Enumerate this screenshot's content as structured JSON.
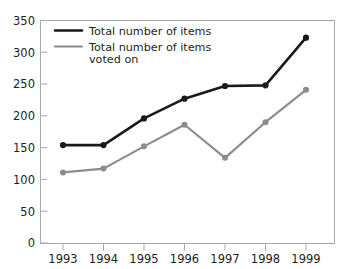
{
  "chart_data": {
    "type": "line",
    "title": "",
    "subtitle": "",
    "xlabel": "",
    "ylabel": "",
    "categories": [
      "1993",
      "1994",
      "1995",
      "1996",
      "1997",
      "1998",
      "1999"
    ],
    "x": [
      1993,
      1994,
      1995,
      1996,
      1997,
      1998,
      1999
    ],
    "xlim": [
      1993,
      1999
    ],
    "ylim": [
      0,
      350
    ],
    "ytick_labels": [
      "0",
      "50",
      "100",
      "150",
      "200",
      "250",
      "300",
      "350"
    ],
    "yticks": [
      0,
      50,
      100,
      150,
      200,
      250,
      300,
      350
    ],
    "grid": false,
    "legend_position": "top-left-inside",
    "series": [
      {
        "name": "Total number of items",
        "color": "#1a1a1a",
        "marker": "circle",
        "values": [
          154,
          154,
          196,
          227,
          247,
          248,
          323
        ]
      },
      {
        "name": "Total number of items voted on",
        "color": "#8c8c8c",
        "marker": "circle",
        "values": [
          111,
          117,
          152,
          186,
          134,
          190,
          241
        ]
      }
    ],
    "legend": [
      {
        "label_line1": "Total number of items",
        "label_line2": "",
        "color": "#1a1a1a"
      },
      {
        "label_line1": "Total number of items",
        "label_line2": "voted on",
        "color": "#8c8c8c"
      }
    ],
    "annotations": []
  },
  "colors": {
    "series_dark": "#1a1a1a",
    "series_gray": "#8c8c8c",
    "axis": "#a7a9ac",
    "text": "#231f20",
    "background": "#ffffff"
  }
}
